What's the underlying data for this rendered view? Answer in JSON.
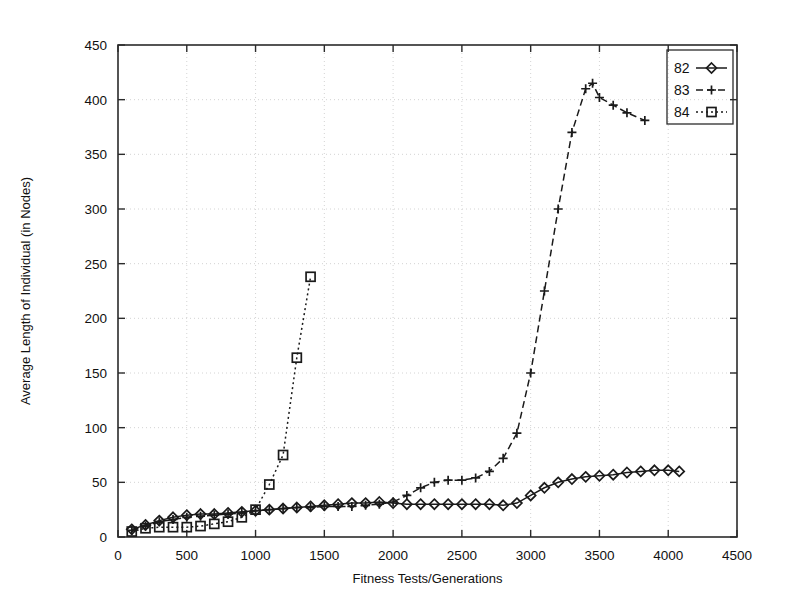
{
  "chart_data": {
    "type": "line",
    "title": "",
    "xlabel": "Fitness Tests/Generations",
    "ylabel": "Average Length of Individual (in Nodes)",
    "xlim": [
      0,
      4500
    ],
    "ylim": [
      0,
      450
    ],
    "xticks": [
      0,
      500,
      1000,
      1500,
      2000,
      2500,
      3000,
      3500,
      4000,
      4500
    ],
    "yticks": [
      0,
      50,
      100,
      150,
      200,
      250,
      300,
      350,
      400,
      450
    ],
    "grid": true,
    "legend_position": "top-right",
    "series": [
      {
        "name": "82",
        "marker": "diamond",
        "line_style": "solid",
        "color": "#1a1a1a",
        "x": [
          100,
          200,
          300,
          400,
          500,
          600,
          700,
          800,
          900,
          1000,
          1100,
          1200,
          1300,
          1400,
          1500,
          1600,
          1700,
          1800,
          1900,
          2000,
          2100,
          2200,
          2300,
          2400,
          2500,
          2600,
          2700,
          2800,
          2900,
          3000,
          3100,
          3200,
          3300,
          3400,
          3500,
          3600,
          3700,
          3800,
          3900,
          4000,
          4080
        ],
        "y": [
          7,
          11,
          15,
          18,
          20,
          21,
          21,
          22,
          23,
          24,
          25,
          26,
          27,
          28,
          29,
          30,
          31,
          31,
          32,
          31,
          30,
          30,
          30,
          30,
          30,
          30,
          30,
          29,
          31,
          38,
          45,
          50,
          53,
          55,
          56,
          57,
          59,
          60,
          61,
          61,
          60
        ]
      },
      {
        "name": "83",
        "marker": "plus",
        "line_style": "dashed",
        "color": "#1a1a1a",
        "x": [
          100,
          200,
          300,
          400,
          500,
          600,
          700,
          800,
          900,
          1000,
          1100,
          1200,
          1300,
          1400,
          1500,
          1600,
          1700,
          1800,
          1900,
          2000,
          2100,
          2200,
          2300,
          2400,
          2500,
          2600,
          2700,
          2800,
          2900,
          3000,
          3100,
          3200,
          3300,
          3400,
          3450,
          3500,
          3600,
          3700,
          3830
        ],
        "y": [
          6,
          10,
          14,
          16,
          18,
          19,
          20,
          21,
          22,
          24,
          25,
          26,
          27,
          27,
          28,
          28,
          28,
          29,
          30,
          32,
          38,
          45,
          50,
          52,
          52,
          54,
          60,
          72,
          95,
          150,
          225,
          300,
          370,
          410,
          415,
          402,
          395,
          388,
          381
        ]
      },
      {
        "name": "84",
        "marker": "square",
        "line_style": "dotted",
        "color": "#1a1a1a",
        "x": [
          100,
          200,
          300,
          400,
          500,
          600,
          700,
          800,
          900,
          1000,
          1100,
          1200,
          1300,
          1400
        ],
        "y": [
          5,
          8,
          9,
          9,
          9,
          10,
          12,
          14,
          18,
          25,
          48,
          75,
          164,
          238
        ]
      }
    ]
  },
  "legend": {
    "entries": [
      {
        "label": "82"
      },
      {
        "label": "83"
      },
      {
        "label": "84"
      }
    ]
  }
}
